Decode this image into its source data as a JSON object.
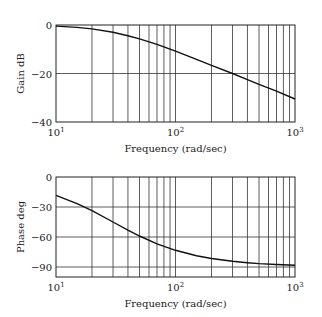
{
  "chart_data": [
    {
      "type": "line",
      "title": "",
      "xlabel": "Frequency (rad/sec)",
      "ylabel": "Gain dB",
      "xscale": "log",
      "xlim": [
        10,
        1000
      ],
      "ylim": [
        -40,
        0
      ],
      "xticks": [
        10,
        100,
        1000
      ],
      "xtick_labels": [
        {
          "base": "10",
          "exp": "1"
        },
        {
          "base": "10",
          "exp": "2"
        },
        {
          "base": "10",
          "exp": "3"
        }
      ],
      "yticks": [
        0,
        -20,
        -40
      ],
      "ytick_labels": [
        "0",
        "−20",
        "−40"
      ],
      "grid": true,
      "series": [
        {
          "name": "Gain",
          "x": [
            10,
            15,
            20,
            30,
            40,
            50,
            70,
            100,
            150,
            200,
            300,
            400,
            500,
            700,
            1000
          ],
          "y": [
            -0.46,
            -0.97,
            -1.6,
            -3.0,
            -4.4,
            -5.7,
            -8.0,
            -10.8,
            -14.2,
            -16.6,
            -20.0,
            -22.5,
            -24.5,
            -27.3,
            -30.5
          ]
        }
      ]
    },
    {
      "type": "line",
      "title": "",
      "xlabel": "Frequency (rad/sec)",
      "ylabel": "Phase deg",
      "xscale": "log",
      "xlim": [
        10,
        1000
      ],
      "ylim": [
        -100,
        0
      ],
      "xticks": [
        10,
        100,
        1000
      ],
      "xtick_labels": [
        {
          "base": "10",
          "exp": "1"
        },
        {
          "base": "10",
          "exp": "2"
        },
        {
          "base": "10",
          "exp": "3"
        }
      ],
      "yticks": [
        0,
        -30,
        -60,
        -90
      ],
      "ytick_labels": [
        "0",
        "−30",
        "−60",
        "−90"
      ],
      "grid": true,
      "series": [
        {
          "name": "Phase",
          "x": [
            10,
            15,
            20,
            30,
            40,
            50,
            70,
            100,
            150,
            200,
            300,
            400,
            500,
            700,
            1000
          ],
          "y": [
            -18.4,
            -26.6,
            -33.7,
            -45.0,
            -53.1,
            -59.0,
            -66.8,
            -73.3,
            -78.7,
            -81.5,
            -84.3,
            -85.7,
            -86.6,
            -87.5,
            -88.3
          ]
        }
      ]
    }
  ]
}
